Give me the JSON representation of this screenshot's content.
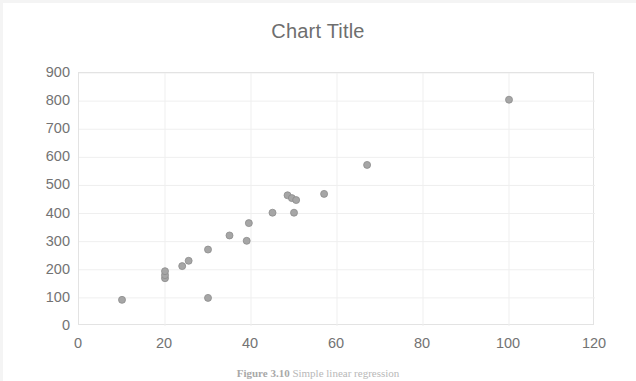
{
  "chart_data": {
    "type": "scatter",
    "title": "Chart Title",
    "xlabel": "",
    "ylabel": "",
    "xlim": [
      0,
      120
    ],
    "ylim": [
      0,
      900
    ],
    "xticks": [
      0,
      20,
      40,
      60,
      80,
      100,
      120
    ],
    "yticks": [
      0,
      100,
      200,
      300,
      400,
      500,
      600,
      700,
      800,
      900
    ],
    "grid": true,
    "legend": false,
    "marker": {
      "shape": "circle",
      "color": "#a6a6a6",
      "edge_color": "#8c8c8c",
      "size": 7
    },
    "series": [
      {
        "name": "Series 1",
        "points": [
          [
            10,
            93
          ],
          [
            20,
            170
          ],
          [
            20,
            181
          ],
          [
            20,
            195
          ],
          [
            24,
            213
          ],
          [
            25.5,
            232
          ],
          [
            30,
            100
          ],
          [
            30,
            272
          ],
          [
            35,
            322
          ],
          [
            39,
            303
          ],
          [
            39.5,
            366
          ],
          [
            45,
            403
          ],
          [
            48.5,
            465
          ],
          [
            49.5,
            455
          ],
          [
            50,
            403
          ],
          [
            50.5,
            448
          ],
          [
            57,
            470
          ],
          [
            67,
            573
          ],
          [
            100,
            805
          ]
        ]
      }
    ]
  },
  "caption": {
    "label": "Figure 3.10",
    "text": "Simple linear regression"
  }
}
